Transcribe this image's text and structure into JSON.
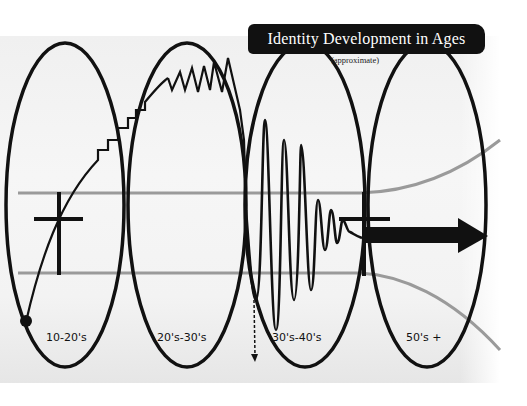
{
  "title": "Identity Development in Ages",
  "subtitle": "(approximate)",
  "stages": [
    {
      "label": "10-20's",
      "pattern": "gradual rise with steps"
    },
    {
      "label": "20's-30's",
      "pattern": "zigzag peaks"
    },
    {
      "label": "30's-40's",
      "pattern": "large oscillations damping out"
    },
    {
      "label": "50's +",
      "pattern": "stable forward arrow"
    }
  ],
  "colors": {
    "ink": "#111111",
    "guide_lines": "#9a9a9a",
    "paper": "#f3f3f3",
    "banner_bg": "#111111",
    "banner_text": "#ffffff"
  },
  "icons": {
    "start_point": "filled-circle",
    "crosses": "plus-sign-markers",
    "dashed_arrow": "dashed-down-arrow",
    "forward_arrow": "thick-right-arrow"
  }
}
